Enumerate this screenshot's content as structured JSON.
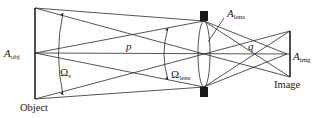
{
  "diagram": {
    "labels": {
      "a_obj": {
        "main": "A",
        "sub": "obj"
      },
      "a_lens": {
        "main": "A",
        "sub": "lens"
      },
      "a_img": {
        "main": "A",
        "sub": "img"
      },
      "omega_s": {
        "main": "Ω",
        "sub": "s"
      },
      "omega_lens": {
        "main": "Ω",
        "sub": "lens"
      },
      "p": "p",
      "q": "q"
    },
    "captions": {
      "object": "Object",
      "image": "Image"
    }
  }
}
